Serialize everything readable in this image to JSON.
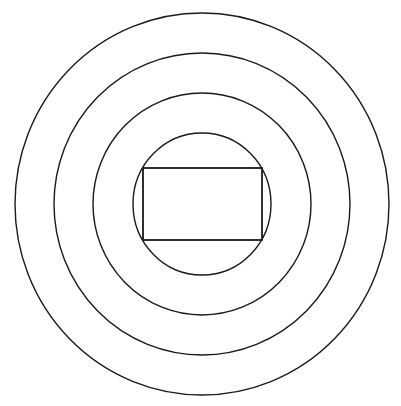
{
  "diagram": {
    "type": "concentric-circles-with-inscribed-rectangle",
    "background": "#ffffff",
    "stroke_color": "#1a1a1a",
    "center": {
      "cx": 202,
      "cy": 204
    },
    "circles": [
      {
        "id": "circle-4",
        "rx": 187,
        "ry": 191
      },
      {
        "id": "circle-3",
        "rx": 148,
        "ry": 151
      },
      {
        "id": "circle-2",
        "rx": 109,
        "ry": 111
      },
      {
        "id": "circle-1",
        "rx": 69,
        "ry": 71
      }
    ],
    "rectangle": {
      "x": 143,
      "y": 168,
      "width": 119,
      "height": 72
    }
  }
}
